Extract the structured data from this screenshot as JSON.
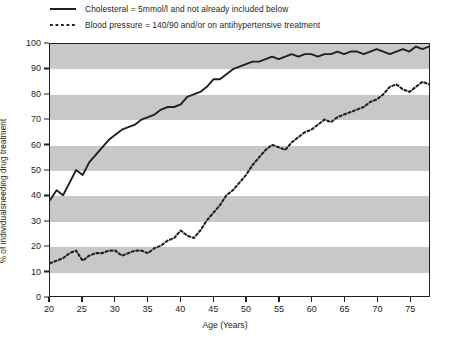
{
  "chart_data": {
    "type": "line",
    "title": "",
    "xlabel": "Age (Years)",
    "ylabel": "% of individualsneeding drug treatment",
    "xlim": [
      20,
      78
    ],
    "ylim": [
      0,
      100
    ],
    "xticks": [
      20,
      25,
      30,
      35,
      40,
      45,
      50,
      55,
      60,
      65,
      70,
      75
    ],
    "yticks": [
      0,
      10,
      20,
      30,
      40,
      50,
      60,
      70,
      80,
      90,
      100
    ],
    "grid": false,
    "banding": "alternating grey horizontal bands every 10 units starting grey at 90-100",
    "band_color": "#c8c8c8",
    "legend_position": "above-plot",
    "series": [
      {
        "name": "Cholesteral = 5mmol/l and not already included below",
        "style": "solid",
        "color": "#231f20",
        "x": [
          20,
          21,
          22,
          23,
          24,
          25,
          26,
          27,
          28,
          29,
          30,
          31,
          32,
          33,
          34,
          35,
          36,
          37,
          38,
          39,
          40,
          41,
          42,
          43,
          44,
          45,
          46,
          47,
          48,
          49,
          50,
          51,
          52,
          53,
          54,
          55,
          56,
          57,
          58,
          59,
          60,
          61,
          62,
          63,
          64,
          65,
          66,
          67,
          68,
          69,
          70,
          71,
          72,
          73,
          74,
          75,
          76,
          77,
          78
        ],
        "y": [
          38,
          42,
          40,
          45,
          50,
          48,
          53,
          56,
          59,
          62,
          64,
          66,
          67,
          68,
          70,
          71,
          72,
          74,
          75,
          75,
          76,
          79,
          80,
          81,
          83,
          86,
          86,
          88,
          90,
          91,
          92,
          93,
          93,
          94,
          95,
          94,
          95,
          96,
          95,
          96,
          96,
          95,
          96,
          96,
          97,
          96,
          97,
          97,
          96,
          97,
          98,
          97,
          96,
          97,
          98,
          97,
          99,
          98,
          99
        ]
      },
      {
        "name": "Blood pressure = 140/90 and/or on antihypertensive treatment",
        "style": "dotted",
        "color": "#231f20",
        "x": [
          20,
          21,
          22,
          23,
          24,
          25,
          26,
          27,
          28,
          29,
          30,
          31,
          32,
          33,
          34,
          35,
          36,
          37,
          38,
          39,
          40,
          41,
          42,
          43,
          44,
          45,
          46,
          47,
          48,
          49,
          50,
          51,
          52,
          53,
          54,
          55,
          56,
          57,
          58,
          59,
          60,
          61,
          62,
          63,
          64,
          65,
          66,
          67,
          68,
          69,
          70,
          71,
          72,
          73,
          74,
          75,
          76,
          77,
          78
        ],
        "y": [
          13,
          14,
          15,
          17,
          18,
          14,
          16,
          17,
          17,
          18,
          18,
          16,
          17,
          18,
          18,
          17,
          19,
          20,
          22,
          23,
          26,
          24,
          23,
          26,
          30,
          33,
          36,
          40,
          42,
          45,
          48,
          52,
          55,
          58,
          60,
          59,
          58,
          61,
          63,
          65,
          66,
          68,
          70,
          69,
          71,
          72,
          73,
          74,
          75,
          77,
          78,
          80,
          83,
          84,
          82,
          81,
          83,
          85,
          84
        ]
      }
    ]
  },
  "axes": {
    "y_tick_labels": [
      "100",
      "90",
      "80",
      "70",
      "60",
      "50",
      "40",
      "30",
      "20",
      "10",
      "0"
    ],
    "x_tick_labels": [
      "20",
      "25",
      "30",
      "35",
      "40",
      "45",
      "50",
      "55",
      "60",
      "65",
      "70",
      "75"
    ],
    "x_title": "Age (Years)",
    "y_title": "% of individualsneeding drug treatment"
  },
  "legend": {
    "items": [
      {
        "label": "Cholesteral = 5mmol/l and not already included below",
        "style": "solid"
      },
      {
        "label": "Blood pressure = 140/90 and/or on antihypertensive treatment",
        "style": "dotted"
      }
    ]
  }
}
